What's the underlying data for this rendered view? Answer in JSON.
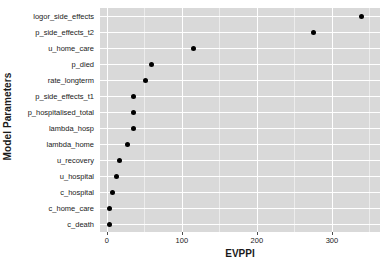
{
  "chart_data": {
    "type": "scatter",
    "title": "",
    "xlabel": "EVPPI",
    "ylabel": "Model Parameters",
    "xlim": [
      -9,
      364
    ],
    "xticks": [
      0,
      100,
      200,
      300
    ],
    "xtick_labels": [
      "0",
      "100",
      "200",
      "300"
    ],
    "grid": true,
    "legend": "none",
    "categories": [
      "logor_side_effects",
      "p_side_effects_t2",
      "u_home_care",
      "p_died",
      "rate_longterm",
      "p_side_effects_t1",
      "p_hospitalised_total",
      "lambda_hosp",
      "lambda_home",
      "u_recovery",
      "u_hospital",
      "c_hospital",
      "c_home_care",
      "c_death"
    ],
    "values": [
      340,
      275,
      116,
      59,
      51,
      36,
      35,
      35,
      28,
      17,
      13,
      7,
      4,
      3
    ],
    "points": [
      {
        "label": "logor_side_effects",
        "value": 340
      },
      {
        "label": "p_side_effects_t2",
        "value": 275
      },
      {
        "label": "u_home_care",
        "value": 116
      },
      {
        "label": "p_died",
        "value": 59
      },
      {
        "label": "rate_longterm",
        "value": 51
      },
      {
        "label": "p_side_effects_t1",
        "value": 36
      },
      {
        "label": "p_hospitalised_total",
        "value": 35
      },
      {
        "label": "lambda_hosp",
        "value": 35
      },
      {
        "label": "lambda_home",
        "value": 28
      },
      {
        "label": "u_recovery",
        "value": 17
      },
      {
        "label": "u_hospital",
        "value": 13
      },
      {
        "label": "c_hospital",
        "value": 7
      },
      {
        "label": "c_home_care",
        "value": 4
      },
      {
        "label": "c_death",
        "value": 3
      }
    ],
    "colors": {
      "point": "#000000",
      "panel_background": "#d9d9d9",
      "grid_major": "#ffffff",
      "grid_minor": "#ececec",
      "text": "#1a1a1a"
    }
  }
}
